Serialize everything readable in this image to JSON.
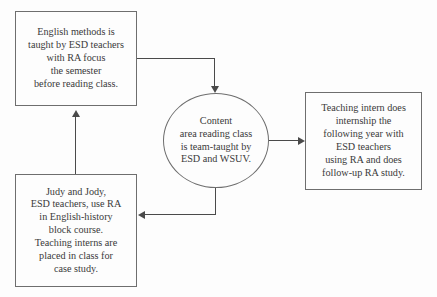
{
  "diagram": {
    "type": "flowchart",
    "title": "",
    "background_color": "#fdfdfd",
    "line_color": "#4a4a4a",
    "text_color": "#3a3a3a",
    "nodes": [
      {
        "id": "english-methods",
        "shape": "rectangle",
        "text": "English methods is\ntaught by ESD teachers\nwith RA focus\nthe semester\nbefore reading class."
      },
      {
        "id": "content-area",
        "shape": "ellipse",
        "text": "Content\narea reading class\nis team-taught by\nESD and WSUV."
      },
      {
        "id": "teaching-intern",
        "shape": "rectangle",
        "text": "Teaching intern does\ninternship the\nfollowing year with\nESD teachers\nusing RA and does\nfollow-up RA study."
      },
      {
        "id": "judy-jody",
        "shape": "rectangle",
        "text": "Judy and Jody,\nESD teachers, use RA\nin English-history\nblock course.\nTeaching interns are\nplaced in class for\ncase study."
      }
    ],
    "edges": [
      {
        "id": "edge-english-to-content",
        "from": "english-methods",
        "to": "content-area",
        "label": "",
        "route": "right-then-down",
        "arrowhead": "down"
      },
      {
        "id": "edge-content-to-intern",
        "from": "content-area",
        "to": "teaching-intern",
        "label": "",
        "route": "straight-right",
        "arrowhead": "right"
      },
      {
        "id": "edge-content-to-judy",
        "from": "content-area",
        "to": "judy-jody",
        "label": "",
        "route": "down-then-left",
        "arrowhead": "left"
      },
      {
        "id": "edge-judy-to-english",
        "from": "judy-jody",
        "to": "english-methods",
        "label": "",
        "route": "straight-up",
        "arrowhead": "up"
      }
    ]
  }
}
